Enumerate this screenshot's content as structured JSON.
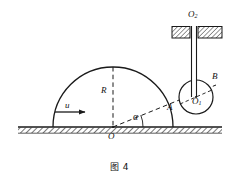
{
  "figure": {
    "caption": "图 4",
    "labels": {
      "center_origin": "O",
      "radius": "R",
      "velocity": "u",
      "angle": "α",
      "point_a": "A",
      "point_b": "B",
      "small_circle_center": "O",
      "small_circle_center_sub": "1",
      "support_point": "O",
      "support_point_sub": "2"
    },
    "colors": {
      "stroke": "#1a1a1a",
      "background": "#ffffff"
    }
  },
  "geometry": {
    "ground": {
      "y": 127,
      "x_start": 18,
      "x_end": 222
    },
    "large_semicircle": {
      "cx": 113,
      "cy": 127,
      "r": 60
    },
    "small_circle": {
      "cx": 196,
      "cy": 97,
      "r": 17
    },
    "radius_line": {
      "x": 113,
      "y_top": 67,
      "y_bottom": 127
    },
    "angle_degrees": 22,
    "dashed_ray": {
      "from": "O",
      "through": "A",
      "to": "B"
    },
    "velocity_arrow": {
      "x_start": 55,
      "x_end": 88,
      "y": 112
    },
    "support_block": {
      "x": 172,
      "y": 26,
      "width": 52,
      "height": 12,
      "gap_x": 192,
      "gap_w": 8
    },
    "rod": {
      "x": 193,
      "y_top": 26,
      "y_bottom": 97,
      "width": 5
    }
  }
}
